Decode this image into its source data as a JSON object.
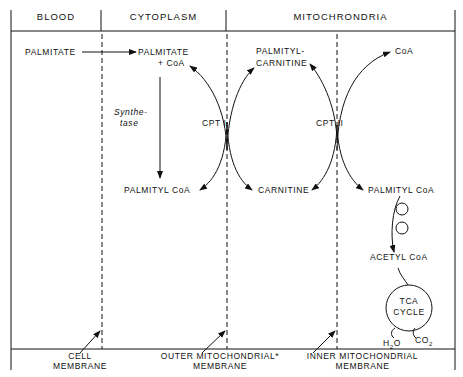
{
  "header": {
    "columns": [
      "BLOOD",
      "CYTOPLASM",
      "MITOCHRONDRIA"
    ]
  },
  "nodes": {
    "palmitate_blood": "PALMITATE",
    "palmitate_cyto_1": "PALMITATE",
    "palmitate_cyto_2": "+ CoA",
    "synthetase_1": "Synthe-",
    "synthetase_2": "tase",
    "palmityl_coa_cyto": "PALMITYL CoA",
    "cpt1": "CPT I",
    "palmitylcarnitine_1": "PALMITYL-",
    "palmitylcarnitine_2": "CARNITINE",
    "carnitine": "CARNITINE",
    "cpt2": "CPT II",
    "coa_mito": "CoA",
    "palmityl_coa_mito": "PALMITYL CoA",
    "acetyl_coa": "ACETYL CoA",
    "tca_1": "TCA",
    "tca_2": "CYCLE",
    "h2o": "H",
    "h2o_sub": "2",
    "h2o_end": "O",
    "co2": "CO",
    "co2_sub": "2"
  },
  "membranes": {
    "cell_1": "CELL",
    "cell_2": "MEMBRANE",
    "outer_1": "OUTER MITOCHONDRIAL*",
    "outer_2": "MEMBRANE",
    "inner_1": "INNER MITOCHONDRIAL",
    "inner_2": "MEMBRANE"
  }
}
